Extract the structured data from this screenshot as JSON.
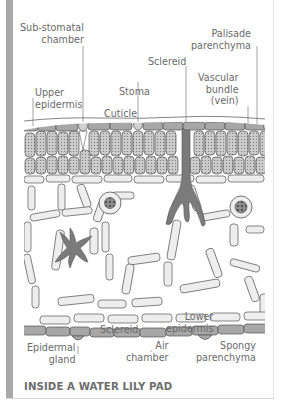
{
  "figure": {
    "title": "INSIDE A WATER LILY PAD",
    "labels": {
      "sub_stomatal_chamber": "Sub-stomatal\nchamber",
      "upper_epidermis": "Upper\nepidermis",
      "stoma": "Stoma",
      "cuticle": "Cuticle",
      "sclereid_top": "Sclereid",
      "palisade_parenchyma": "Palisade\nparenchyma",
      "vascular_bundle": "Vascular\nbundle\n(vein)",
      "epidermal_gland": "Epidermal\ngland",
      "sclereid_bottom": "Sclereid",
      "air_chamber": "Air\nchamber",
      "lower_epidermis": "Lower\nepidermis",
      "spongy_parenchyma": "Spongy\nparenchyma"
    },
    "colors": {
      "label_text": "#6a6a6a",
      "leader_line": "#8a8a8a",
      "epidermis_fill": "#a7a7a7",
      "palisade_fill": "#c9c9c9",
      "spongy_fill": "#eeeeee",
      "sclereid_fill": "#7b7b7b",
      "side_bar": "#a9a9a9"
    }
  }
}
